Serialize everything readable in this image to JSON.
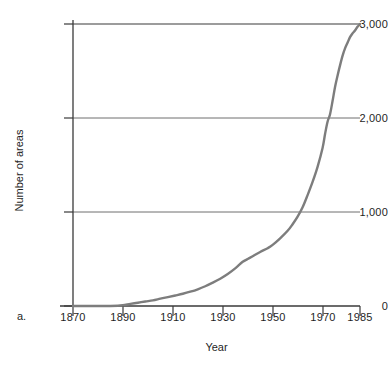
{
  "figure": {
    "panel_label": "a.",
    "background_color": "#ffffff"
  },
  "chart_data": {
    "type": "line",
    "title": "",
    "subtitle": "",
    "xlabel": "Year",
    "ylabel": "Number of areas",
    "xlim": [
      1870,
      1985
    ],
    "ylim": [
      0,
      3000
    ],
    "grid": true,
    "grid_axis": "y",
    "gridlines_y": [
      1000,
      2000,
      3000
    ],
    "legend": false,
    "legend_position": "none",
    "xticks": [
      1870,
      1890,
      1910,
      1930,
      1950,
      1970,
      1985
    ],
    "xtick_labels": [
      "1870",
      "1890",
      "1910",
      "1930",
      "1950",
      "1970",
      "1985"
    ],
    "yticks": [
      0,
      1000,
      2000,
      3000
    ],
    "ytick_labels": [
      "0",
      "1,000",
      "2,000",
      "3,000"
    ],
    "line_color": "#7d7d7d",
    "line_width": 2.4,
    "series": [
      {
        "name": "Cumulative number of protected areas",
        "x": [
          1870,
          1875,
          1880,
          1885,
          1888,
          1890,
          1893,
          1896,
          1899,
          1902,
          1905,
          1908,
          1911,
          1914,
          1917,
          1920,
          1923,
          1926,
          1929,
          1932,
          1935,
          1938,
          1940,
          1942,
          1945,
          1948,
          1950,
          1953,
          1956,
          1958,
          1960,
          1962,
          1964,
          1966,
          1968,
          1970,
          1971,
          1972,
          1973,
          1974,
          1975,
          1976,
          1977,
          1978,
          1979,
          1980,
          1981,
          1982,
          1983,
          1984,
          1985
        ],
        "values": [
          0,
          0,
          0,
          0,
          2,
          8,
          22,
          35,
          48,
          60,
          78,
          95,
          112,
          130,
          152,
          178,
          210,
          248,
          290,
          340,
          400,
          470,
          500,
          530,
          575,
          615,
          650,
          720,
          800,
          870,
          950,
          1050,
          1180,
          1320,
          1480,
          1680,
          1830,
          1960,
          2040,
          2180,
          2330,
          2450,
          2560,
          2660,
          2740,
          2800,
          2860,
          2900,
          2930,
          2970,
          3000
        ]
      }
    ],
    "annotations": []
  },
  "axis": {
    "y_title": "Number of areas",
    "x_title": "Year"
  }
}
